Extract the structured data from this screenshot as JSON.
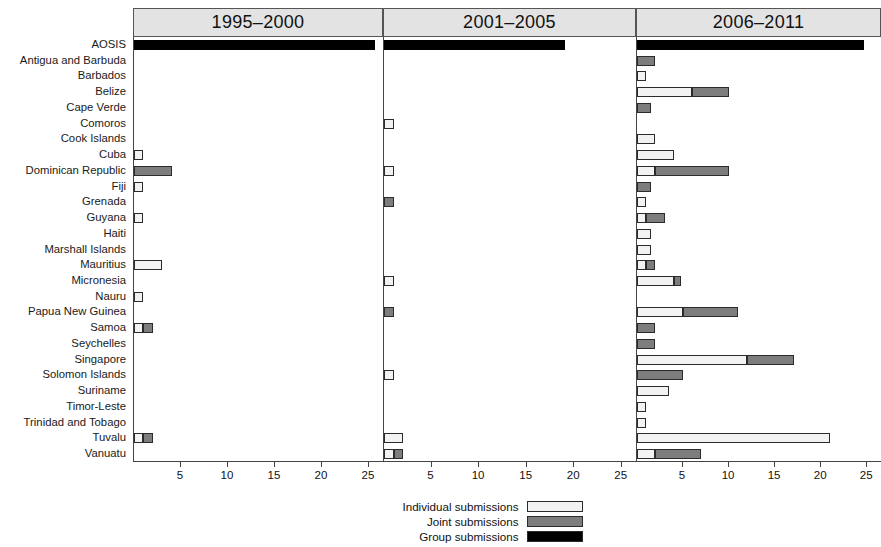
{
  "chart_data": {
    "type": "bar",
    "title": "",
    "subtitle": "",
    "orientation": "horizontal",
    "stacked": true,
    "grid": false,
    "legend_position": "bottom-center",
    "xlabel": "",
    "ylabel": "",
    "xlim": [
      0,
      26.5
    ],
    "xticks": [
      5,
      10,
      15,
      20,
      25
    ],
    "xtick_labels": [
      "5",
      "10",
      "15",
      "20",
      "25"
    ],
    "panels": [
      "1995–2000",
      "2001–2005",
      "2006–2011"
    ],
    "categories": [
      "AOSIS",
      "Antigua and Barbuda",
      "Barbados",
      "Belize",
      "Cape Verde",
      "Comoros",
      "Cook Islands",
      "Cuba",
      "Dominican Republic",
      "Fiji",
      "Grenada",
      "Guyana",
      "Haiti",
      "Marshall Islands",
      "Mauritius",
      "Micronesia",
      "Nauru",
      "Papua New Guinea",
      "Samoa",
      "Seychelles",
      "Singapore",
      "Solomon Islands",
      "Suriname",
      "Timor-Leste",
      "Trinidad and Tobago",
      "Tuvalu",
      "Vanuatu"
    ],
    "series": [
      {
        "name": "Individual submissions",
        "color": "#f2f2f2"
      },
      {
        "name": "Joint submissions",
        "color": "#7d7d7d"
      },
      {
        "name": "Group submissions",
        "color": "#000000"
      }
    ],
    "values": {
      "1995–2000": {
        "AOSIS": {
          "individual": 0,
          "joint": 0,
          "group": 25.6
        },
        "Antigua and Barbuda": {
          "individual": 0,
          "joint": 0,
          "group": 0
        },
        "Barbados": {
          "individual": 0,
          "joint": 0,
          "group": 0
        },
        "Belize": {
          "individual": 0,
          "joint": 0,
          "group": 0
        },
        "Cape Verde": {
          "individual": 0,
          "joint": 0,
          "group": 0
        },
        "Comoros": {
          "individual": 0,
          "joint": 0,
          "group": 0
        },
        "Cook Islands": {
          "individual": 0,
          "joint": 0,
          "group": 0
        },
        "Cuba": {
          "individual": 1,
          "joint": 0,
          "group": 0
        },
        "Dominican Republic": {
          "individual": 0,
          "joint": 4,
          "group": 0
        },
        "Fiji": {
          "individual": 1,
          "joint": 0,
          "group": 0
        },
        "Grenada": {
          "individual": 0,
          "joint": 0,
          "group": 0
        },
        "Guyana": {
          "individual": 1,
          "joint": 0,
          "group": 0
        },
        "Haiti": {
          "individual": 0,
          "joint": 0,
          "group": 0
        },
        "Marshall Islands": {
          "individual": 0,
          "joint": 0,
          "group": 0
        },
        "Mauritius": {
          "individual": 3,
          "joint": 0,
          "group": 0
        },
        "Micronesia": {
          "individual": 0,
          "joint": 0,
          "group": 0
        },
        "Nauru": {
          "individual": 1,
          "joint": 0,
          "group": 0
        },
        "Papua New Guinea": {
          "individual": 0,
          "joint": 0,
          "group": 0
        },
        "Samoa": {
          "individual": 1,
          "joint": 1,
          "group": 0
        },
        "Seychelles": {
          "individual": 0,
          "joint": 0,
          "group": 0
        },
        "Singapore": {
          "individual": 0,
          "joint": 0,
          "group": 0
        },
        "Solomon Islands": {
          "individual": 0,
          "joint": 0,
          "group": 0
        },
        "Suriname": {
          "individual": 0,
          "joint": 0,
          "group": 0
        },
        "Timor-Leste": {
          "individual": 0,
          "joint": 0,
          "group": 0
        },
        "Trinidad and Tobago": {
          "individual": 0,
          "joint": 0,
          "group": 0
        },
        "Tuvalu": {
          "individual": 1,
          "joint": 1,
          "group": 0
        },
        "Vanuatu": {
          "individual": 0,
          "joint": 0,
          "group": 0
        }
      },
      "2001–2005": {
        "AOSIS": {
          "individual": 0,
          "joint": 0,
          "group": 19
        },
        "Antigua and Barbuda": {
          "individual": 0,
          "joint": 0,
          "group": 0
        },
        "Barbados": {
          "individual": 0,
          "joint": 0,
          "group": 0
        },
        "Belize": {
          "individual": 0,
          "joint": 0,
          "group": 0
        },
        "Cape Verde": {
          "individual": 0,
          "joint": 0,
          "group": 0
        },
        "Comoros": {
          "individual": 1,
          "joint": 0,
          "group": 0
        },
        "Cook Islands": {
          "individual": 0,
          "joint": 0,
          "group": 0
        },
        "Cuba": {
          "individual": 0,
          "joint": 0,
          "group": 0
        },
        "Dominican Republic": {
          "individual": 1,
          "joint": 0,
          "group": 0
        },
        "Fiji": {
          "individual": 0,
          "joint": 0,
          "group": 0
        },
        "Grenada": {
          "individual": 0,
          "joint": 1,
          "group": 0
        },
        "Guyana": {
          "individual": 0,
          "joint": 0,
          "group": 0
        },
        "Haiti": {
          "individual": 0,
          "joint": 0,
          "group": 0
        },
        "Marshall Islands": {
          "individual": 0,
          "joint": 0,
          "group": 0
        },
        "Mauritius": {
          "individual": 0,
          "joint": 0,
          "group": 0
        },
        "Micronesia": {
          "individual": 1,
          "joint": 0,
          "group": 0
        },
        "Nauru": {
          "individual": 0,
          "joint": 0,
          "group": 0
        },
        "Papua New Guinea": {
          "individual": 0,
          "joint": 1,
          "group": 0
        },
        "Samoa": {
          "individual": 0,
          "joint": 0,
          "group": 0
        },
        "Seychelles": {
          "individual": 0,
          "joint": 0,
          "group": 0
        },
        "Singapore": {
          "individual": 0,
          "joint": 0,
          "group": 0
        },
        "Solomon Islands": {
          "individual": 1,
          "joint": 0,
          "group": 0
        },
        "Suriname": {
          "individual": 0,
          "joint": 0,
          "group": 0
        },
        "Timor-Leste": {
          "individual": 0,
          "joint": 0,
          "group": 0
        },
        "Trinidad and Tobago": {
          "individual": 0,
          "joint": 0,
          "group": 0
        },
        "Tuvalu": {
          "individual": 2,
          "joint": 0,
          "group": 0
        },
        "Vanuatu": {
          "individual": 1,
          "joint": 1,
          "group": 0
        }
      },
      "2006–2011": {
        "AOSIS": {
          "individual": 0,
          "joint": 0,
          "group": 24.7
        },
        "Antigua and Barbuda": {
          "individual": 0,
          "joint": 2,
          "group": 0
        },
        "Barbados": {
          "individual": 1,
          "joint": 0,
          "group": 0
        },
        "Belize": {
          "individual": 6,
          "joint": 4,
          "group": 0
        },
        "Cape Verde": {
          "individual": 0,
          "joint": 1.5,
          "group": 0
        },
        "Comoros": {
          "individual": 0,
          "joint": 0,
          "group": 0
        },
        "Cook Islands": {
          "individual": 2,
          "joint": 0,
          "group": 0
        },
        "Cuba": {
          "individual": 4,
          "joint": 0,
          "group": 0
        },
        "Dominican Republic": {
          "individual": 2,
          "joint": 8,
          "group": 0
        },
        "Fiji": {
          "individual": 0,
          "joint": 1.5,
          "group": 0
        },
        "Grenada": {
          "individual": 1,
          "joint": 0,
          "group": 0
        },
        "Guyana": {
          "individual": 1,
          "joint": 2,
          "group": 0
        },
        "Haiti": {
          "individual": 1.5,
          "joint": 0,
          "group": 0
        },
        "Marshall Islands": {
          "individual": 1.5,
          "joint": 0,
          "group": 0
        },
        "Mauritius": {
          "individual": 1,
          "joint": 1,
          "group": 0
        },
        "Micronesia": {
          "individual": 4,
          "joint": 0.8,
          "group": 0
        },
        "Nauru": {
          "individual": 0,
          "joint": 0,
          "group": 0
        },
        "Papua New Guinea": {
          "individual": 5,
          "joint": 6,
          "group": 0
        },
        "Samoa": {
          "individual": 0,
          "joint": 2,
          "group": 0
        },
        "Seychelles": {
          "individual": 0,
          "joint": 2,
          "group": 0
        },
        "Singapore": {
          "individual": 12,
          "joint": 5,
          "group": 0
        },
        "Solomon Islands": {
          "individual": 0,
          "joint": 5,
          "group": 0
        },
        "Suriname": {
          "individual": 3.5,
          "joint": 0,
          "group": 0
        },
        "Timor-Leste": {
          "individual": 1,
          "joint": 0,
          "group": 0
        },
        "Trinidad and Tobago": {
          "individual": 1,
          "joint": 0,
          "group": 0
        },
        "Tuvalu": {
          "individual": 21,
          "joint": 0,
          "group": 0
        },
        "Vanuatu": {
          "individual": 2,
          "joint": 5,
          "group": 0
        }
      }
    }
  },
  "legend": {
    "items": [
      {
        "label": "Individual submissions",
        "key": "individual"
      },
      {
        "label": "Joint submissions",
        "key": "joint"
      },
      {
        "label": "Group submissions",
        "key": "group"
      }
    ]
  },
  "colors": {
    "individual": "#f2f2f2",
    "joint": "#7d7d7d",
    "group": "#000000",
    "panel_strip": "#e3e3e3",
    "outline": "#2b2b2b"
  }
}
